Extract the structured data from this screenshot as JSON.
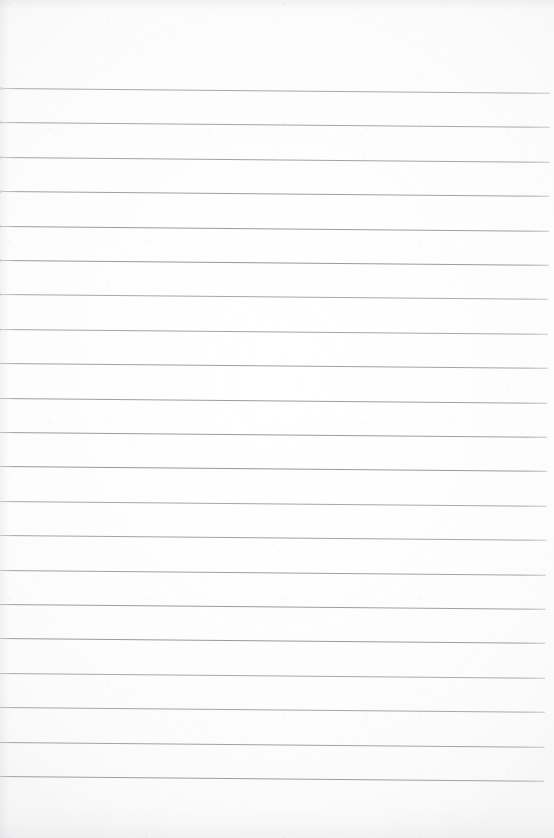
{
  "document": {
    "kind": "scanned-lined-paper",
    "title": "Blank ruled notebook page",
    "page_width": 554,
    "page_height": 838,
    "paper_color": "#fdfdfd",
    "rule_color": "#8a8c94",
    "has_written_content": false,
    "written_text": "",
    "header_text": "",
    "footer_text": "",
    "page_number": "",
    "margin_rule": {
      "present": false,
      "color": ""
    },
    "ruling": {
      "line_count": 21,
      "first_line_y": 88,
      "line_spacing": 34.4,
      "line_thickness": 1,
      "line_left_x": 3,
      "line_right_x": 551,
      "skew_degrees": 0.5,
      "top_margin": 88,
      "bottom_margin": 62,
      "lines_y": [
        88,
        122,
        157,
        191,
        226,
        260,
        294,
        329,
        363,
        398,
        432,
        466,
        501,
        535,
        570,
        604,
        638,
        673,
        707,
        742,
        776
      ]
    }
  }
}
